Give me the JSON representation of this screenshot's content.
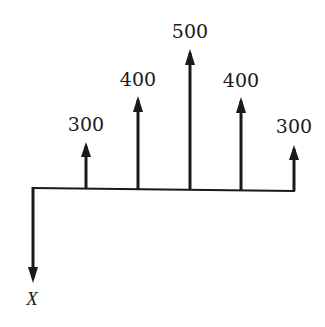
{
  "diagram": {
    "type": "cash-flow-diagram",
    "baseline": {
      "x_start": 33,
      "x_end": 295,
      "y_left": 188,
      "y_right": 191
    },
    "arrows_up": [
      {
        "label": "300",
        "x": 86,
        "tip_y": 142,
        "label_y": 131
      },
      {
        "label": "400",
        "x": 138,
        "tip_y": 96,
        "label_y": 86
      },
      {
        "label": "500",
        "x": 190,
        "tip_y": 49,
        "label_y": 38
      },
      {
        "label": "400",
        "x": 241,
        "tip_y": 97,
        "label_y": 87
      },
      {
        "label": "300",
        "x": 294,
        "tip_y": 145,
        "label_y": 133
      }
    ],
    "arrow_down": {
      "label": "X",
      "x": 33,
      "tip_y": 283,
      "label_y": 305
    },
    "stroke_color": "#1a1a1a"
  }
}
